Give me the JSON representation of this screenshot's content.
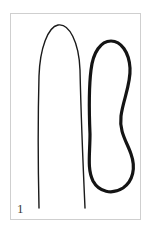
{
  "figure": {
    "label": "1",
    "label_name": "panel-number",
    "background_color": "#ffffff",
    "frame_border_color": "#cfcfcf",
    "frame": {
      "x": 10,
      "y": 13,
      "width": 131,
      "height": 207
    },
    "canvas": {
      "width": 151,
      "height": 232
    }
  },
  "shapes": {
    "left_curve": {
      "name": "hairpin-curve",
      "kind": "open-path",
      "stroke_color": "#1a1a1a",
      "stroke_width": 1.4,
      "description": "Tall narrow hairpin: rounded apex near top, two nearly vertical legs descending to the bottom edge, slightly splaying outward.",
      "path": "M 28 194 C 27 150 27 100 28 62 C 29 34 37 13 47 11 C 58 9 68 28 69 56 C 70 100 72 150 74 194"
    },
    "right_curve": {
      "name": "closed-loop-curve",
      "kind": "closed-path",
      "stroke_color": "#141414",
      "stroke_width": 3.2,
      "description": "Elongated closed loop, rounded cap at top, a concave waist on the right side at mid-height, widening into a rounded lobe at the bottom.",
      "path": "M 79 120 C 78 96 78 72 80 56 C 82 38 90 27 100 27 C 110 27 118 38 119 54 C 120 70 112 86 110 102 C 108 118 116 128 120 140 C 125 154 122 167 112 174 C 101 181 88 178 82 167 C 76 155 79 140 79 120 Z"
    }
  },
  "colors": {
    "ink": "#141414",
    "ink_light": "#1a1a1a",
    "frame": "#cfcfcf",
    "paper": "#ffffff",
    "label_text": "#3a3a3a"
  }
}
